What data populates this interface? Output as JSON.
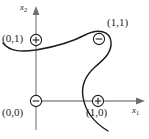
{
  "figure": {
    "background_color": "#ffffff",
    "ink_color": "#1c1c1c",
    "axis_color": "#8c8c8c",
    "curve_color": "#1c1c1c",
    "width": 149,
    "height": 139
  },
  "axes": {
    "x_axis": {
      "name": "x1",
      "label": "x",
      "subscript": "1",
      "position": "bottom-right",
      "arrow": true,
      "y_pixel": 101,
      "x_start": 30,
      "x_end": 144
    },
    "y_axis": {
      "name": "x2",
      "label": "x",
      "subscript": "2",
      "position": "top",
      "arrow": true,
      "x_pixel": 36,
      "y_start": 9,
      "y_end": 130
    }
  },
  "points": [
    {
      "id": "p00",
      "label": "(0,0)",
      "sign": "minus",
      "marker": "circled-minus",
      "marker_glyph": "⊖",
      "x": 0,
      "y": 0,
      "cx": 36,
      "cy": 101,
      "label_x": 2,
      "label_y": 107
    },
    {
      "id": "p01",
      "label": "(0,1)",
      "sign": "plus",
      "marker": "circled-plus",
      "marker_glyph": "⊕",
      "x": 0,
      "y": 1,
      "cx": 36,
      "cy": 40,
      "label_x": 2,
      "label_y": 33
    },
    {
      "id": "p10",
      "label": "(1,0)",
      "sign": "plus",
      "marker": "circled-plus",
      "marker_glyph": "⊕",
      "x": 1,
      "y": 0,
      "cx": 98,
      "cy": 101,
      "label_x": 86,
      "label_y": 107
    },
    {
      "id": "p11",
      "label": "(1,1)",
      "sign": "minus",
      "marker": "circled-minus",
      "marker_glyph": "⊖",
      "x": 1,
      "y": 1,
      "cx": 99,
      "cy": 39,
      "label_x": 107,
      "label_y": 17
    }
  ],
  "curve": {
    "name": "decision-boundary",
    "description": "S-shaped separating curve passing between the plus and minus points",
    "path": "M 3,43 C 10,52 22,52 36,50 C 54,47 72,42 85,35 C 98,28 110,31 111,42 C 112,53 103,60 95,67 C 86,75 81,85 83,97 C 85,110 93,122 108,131"
  }
}
